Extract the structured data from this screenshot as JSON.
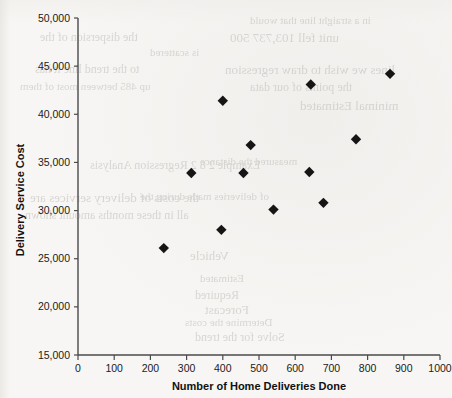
{
  "chart_data": {
    "type": "scatter",
    "title": "",
    "xlabel": "Number of Home Deliveries Done",
    "ylabel": "Delivery Service Cost",
    "xlim": [
      0,
      1000
    ],
    "ylim": [
      15000,
      50000
    ],
    "xticks": [
      0,
      100,
      200,
      300,
      400,
      500,
      600,
      700,
      800,
      900,
      1000
    ],
    "xtick_labels": [
      "0",
      "100",
      "200",
      "300",
      "400",
      "500",
      "600",
      "700",
      "800",
      "900",
      "1000"
    ],
    "yticks": [
      15000,
      20000,
      25000,
      30000,
      35000,
      40000,
      45000,
      50000
    ],
    "ytick_labels": [
      "15,000",
      "20,000",
      "25,000",
      "30,000",
      "35,000",
      "40,000",
      "45,000",
      "50,000"
    ],
    "grid": false,
    "legend": false,
    "marker": "diamond",
    "marker_color": "#151515",
    "points": [
      {
        "x": 237,
        "y": 26100
      },
      {
        "x": 313,
        "y": 33900
      },
      {
        "x": 396,
        "y": 28000
      },
      {
        "x": 400,
        "y": 41400
      },
      {
        "x": 457,
        "y": 33900
      },
      {
        "x": 477,
        "y": 36800
      },
      {
        "x": 540,
        "y": 30100
      },
      {
        "x": 639,
        "y": 34000
      },
      {
        "x": 643,
        "y": 43100
      },
      {
        "x": 678,
        "y": 30800
      },
      {
        "x": 768,
        "y": 37400
      },
      {
        "x": 862,
        "y": 44200
      }
    ]
  },
  "page": {
    "background_color": "#f7f6f4",
    "ghost_text": [
      {
        "text": "in a straight line that would",
        "x": 250,
        "y": 14
      },
      {
        "text": "the dispersion of the",
        "x": 40,
        "y": 30
      },
      {
        "text": "unit fell 103,737 500",
        "x": 230,
        "y": 30
      },
      {
        "text": "is scattered",
        "x": 150,
        "y": 46
      },
      {
        "text": "to the trend line it has",
        "x": 35,
        "y": 62
      },
      {
        "text": "lines we wish to draw regression",
        "x": 225,
        "y": 62
      },
      {
        "text": "up 485 between most of them",
        "x": 20,
        "y": 80
      },
      {
        "text": "the points of our data",
        "x": 250,
        "y": 80
      },
      {
        "text": "minimal Estimated",
        "x": 300,
        "y": 98
      },
      {
        "text": "measured the distance",
        "x": 200,
        "y": 155
      },
      {
        "text": "Example 2 8 2  Regression Analysis",
        "x": 90,
        "y": 158
      },
      {
        "text": "the costs of delivery services are",
        "x": 30,
        "y": 190
      },
      {
        "text": "of deliveries made during the",
        "x": 140,
        "y": 190
      },
      {
        "text": "all in these months amount shown",
        "x": 25,
        "y": 208
      },
      {
        "text": "Vehicle",
        "x": 190,
        "y": 248
      },
      {
        "text": "Estimated",
        "x": 200,
        "y": 272
      },
      {
        "text": "Required",
        "x": 195,
        "y": 288
      },
      {
        "text": "Forecast",
        "x": 205,
        "y": 302
      },
      {
        "text": "Determine the costs",
        "x": 185,
        "y": 316
      },
      {
        "text": "Solve for the trend",
        "x": 195,
        "y": 330
      }
    ]
  }
}
